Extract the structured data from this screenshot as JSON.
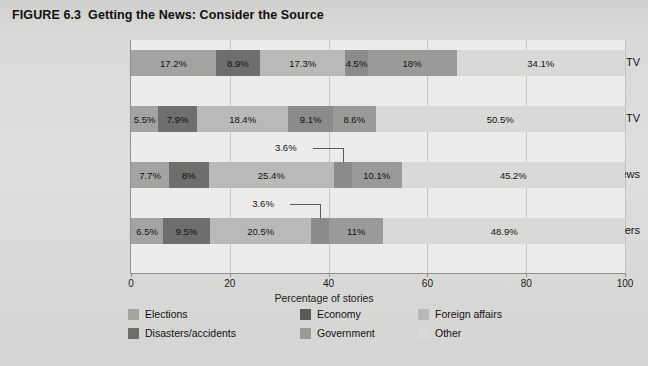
{
  "title": {
    "figure_number": "FIGURE 6.3",
    "text": "Getting the News: Consider the Source"
  },
  "chart_data": {
    "type": "bar",
    "orientation": "horizontal",
    "stacked": true,
    "title": "Getting the News: Consider the Source",
    "xlabel": "Percentage of stories",
    "ylabel": "",
    "xlim": [
      0,
      100
    ],
    "xticks": [
      "0",
      "20",
      "40",
      "60",
      "80",
      "100"
    ],
    "grid": true,
    "legend_position": "bottom",
    "categories": [
      "Cable TV",
      "Network TV",
      "Online news",
      "Newspapers"
    ],
    "series": [
      {
        "name": "Elections",
        "color": "#a3a3a1",
        "values": [
          17.2,
          5.5,
          7.7,
          6.5
        ]
      },
      {
        "name": "Disasters/accidents",
        "color": "#6e6e6c",
        "values": [
          8.9,
          7.9,
          8.0,
          9.5
        ]
      },
      {
        "name": "Economy",
        "color": "#5a5a58",
        "values": [
          0,
          0,
          0,
          0
        ]
      },
      {
        "name": "Foreign affairs",
        "color": "#b9b9b7",
        "values": [
          17.3,
          18.4,
          25.4,
          20.5
        ]
      },
      {
        "name": "Government",
        "color": "#8b8b89",
        "values": [
          4.5,
          9.1,
          3.6,
          3.6
        ]
      },
      {
        "name": "Other",
        "color": "#d9d9d7",
        "values": [
          34.1,
          50.5,
          45.2,
          48.9
        ]
      }
    ],
    "bars": [
      {
        "category": "Cable TV",
        "segments": [
          {
            "series": "Elections",
            "value": 17.2,
            "label": "17.2%",
            "color": "#a3a3a1",
            "callout": false
          },
          {
            "series": "Disasters/accidents",
            "value": 8.9,
            "label": "8.9%",
            "color": "#6e6e6c",
            "callout": false
          },
          {
            "series": "Foreign affairs",
            "value": 17.3,
            "label": "17.3%",
            "color": "#b9b9b7",
            "callout": false
          },
          {
            "series": "Government",
            "value": 4.5,
            "label": "4.5%",
            "color": "#8b8b89",
            "callout": false
          },
          {
            "series": "Economy",
            "value": 18.0,
            "label": "18%",
            "color": "#9a9a98",
            "callout": false
          },
          {
            "series": "Other",
            "value": 34.1,
            "label": "34.1%",
            "color": "#d9d9d7",
            "callout": false
          }
        ]
      },
      {
        "category": "Network TV",
        "segments": [
          {
            "series": "Elections",
            "value": 5.5,
            "label": "5.5%",
            "color": "#a3a3a1",
            "callout": false
          },
          {
            "series": "Disasters/accidents",
            "value": 7.9,
            "label": "7.9%",
            "color": "#6e6e6c",
            "callout": false
          },
          {
            "series": "Foreign affairs",
            "value": 18.4,
            "label": "18.4%",
            "color": "#b9b9b7",
            "callout": false
          },
          {
            "series": "Government",
            "value": 9.1,
            "label": "9.1%",
            "color": "#8b8b89",
            "callout": false
          },
          {
            "series": "Economy",
            "value": 8.6,
            "label": "8.6%",
            "color": "#9a9a98",
            "callout": false
          },
          {
            "series": "Other",
            "value": 50.5,
            "label": "50.5%",
            "color": "#d9d9d7",
            "callout": false
          }
        ]
      },
      {
        "category": "Online news",
        "segments": [
          {
            "series": "Elections",
            "value": 7.7,
            "label": "7.7%",
            "color": "#a3a3a1",
            "callout": false
          },
          {
            "series": "Disasters/accidents",
            "value": 8.0,
            "label": "8%",
            "color": "#6e6e6c",
            "callout": false
          },
          {
            "series": "Foreign affairs",
            "value": 25.4,
            "label": "25.4%",
            "color": "#b9b9b7",
            "callout": false
          },
          {
            "series": "Government",
            "value": 3.6,
            "label": "3.6%",
            "color": "#8b8b89",
            "callout": true
          },
          {
            "series": "Economy",
            "value": 10.1,
            "label": "10.1%",
            "color": "#9a9a98",
            "callout": false
          },
          {
            "series": "Other",
            "value": 45.2,
            "label": "45.2%",
            "color": "#d9d9d7",
            "callout": false
          }
        ]
      },
      {
        "category": "Newspapers",
        "segments": [
          {
            "series": "Elections",
            "value": 6.5,
            "label": "6.5%",
            "color": "#a3a3a1",
            "callout": false
          },
          {
            "series": "Disasters/accidents",
            "value": 9.5,
            "label": "9.5%",
            "color": "#6e6e6c",
            "callout": false
          },
          {
            "series": "Foreign affairs",
            "value": 20.5,
            "label": "20.5%",
            "color": "#b9b9b7",
            "callout": false
          },
          {
            "series": "Government",
            "value": 3.6,
            "label": "3.6%",
            "color": "#8b8b89",
            "callout": true
          },
          {
            "series": "Economy",
            "value": 11.0,
            "label": "11%",
            "color": "#9a9a98",
            "callout": false
          },
          {
            "series": "Other",
            "value": 48.9,
            "label": "48.9%",
            "color": "#d9d9d7",
            "callout": false
          }
        ]
      }
    ]
  },
  "legend": {
    "items": [
      {
        "label": "Elections",
        "color": "#a3a3a1"
      },
      {
        "label": "Economy",
        "color": "#5a5a58"
      },
      {
        "label": "Foreign affairs",
        "color": "#b9b9b7"
      },
      {
        "label": "Disasters/accidents",
        "color": "#6e6e6c"
      },
      {
        "label": "Government",
        "color": "#9a9a98"
      },
      {
        "label": "Other",
        "color": "#d9d9d7"
      }
    ]
  }
}
